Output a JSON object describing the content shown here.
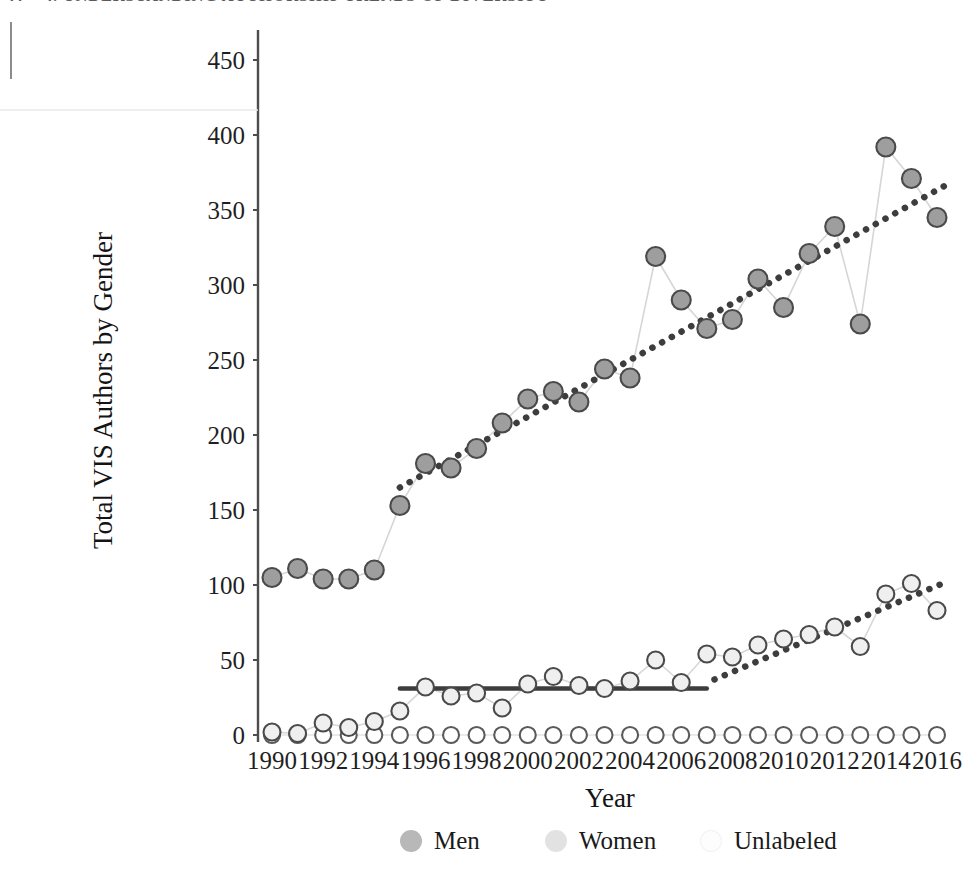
{
  "page_header": {
    "number": "44",
    "title": "4. UNDERSTANDING AUTHORSHIP TRENDS OF DIVERSITY"
  },
  "axis_titles": {
    "y": "Total VIS Authors by Gender",
    "x": "Year"
  },
  "legend": {
    "items": [
      {
        "label": "Men",
        "color": "#b8b8b8"
      },
      {
        "label": "Women",
        "color": "#e2e2e2"
      },
      {
        "label": "Unlabeled",
        "color": "#fdfdfd"
      }
    ]
  },
  "chart_data": {
    "type": "line",
    "title": "",
    "xlabel": "Year",
    "ylabel": "Total VIS Authors by Gender",
    "xlim": [
      1989.4,
      2016.8
    ],
    "ylim": [
      -12,
      462
    ],
    "yticks": [
      0,
      50,
      100,
      150,
      200,
      250,
      300,
      350,
      400,
      450
    ],
    "xticks": [
      1990,
      1992,
      1994,
      1996,
      1998,
      2000,
      2002,
      2004,
      2006,
      2008,
      2010,
      2012,
      2014,
      2016
    ],
    "grid": false,
    "legend_position": "bottom",
    "x": [
      1990,
      1991,
      1992,
      1993,
      1994,
      1995,
      1996,
      1997,
      1998,
      1999,
      2000,
      2001,
      2002,
      2003,
      2004,
      2005,
      2006,
      2007,
      2008,
      2009,
      2010,
      2011,
      2012,
      2013,
      2014,
      2015,
      2016
    ],
    "series": [
      {
        "name": "Men",
        "color": "#9e9e9e",
        "edge": "#4a4a4a",
        "values": [
          105,
          111,
          104,
          104,
          110,
          153,
          181,
          178,
          191,
          208,
          224,
          229,
          222,
          244,
          238,
          319,
          290,
          271,
          277,
          304,
          285,
          321,
          339,
          274,
          392,
          371,
          345
        ],
        "trendline": {
          "style": "dotted",
          "x_start": 1995,
          "x_end": 2016.5,
          "y_start": 165,
          "y_end": 368
        }
      },
      {
        "name": "Women",
        "color": "#efefef",
        "edge": "#4a4a4a",
        "values": [
          2,
          1,
          8,
          5,
          9,
          16,
          32,
          26,
          28,
          18,
          34,
          39,
          33,
          31,
          36,
          50,
          35,
          54,
          52,
          60,
          64,
          67,
          72,
          59,
          94,
          101,
          83
        ],
        "trendlines": [
          {
            "style": "solid",
            "x_start": 1995,
            "x_end": 2007,
            "y_start": 31,
            "y_end": 31
          },
          {
            "style": "dotted",
            "x_start": 2007.3,
            "x_end": 2016.5,
            "y_start": 37,
            "y_end": 103
          }
        ]
      },
      {
        "name": "Unlabeled",
        "color": "#ffffff",
        "edge": "#5a5a5a",
        "values": [
          0,
          0,
          0,
          0,
          0,
          0,
          0,
          0,
          0,
          0,
          0,
          0,
          0,
          0,
          0,
          0,
          0,
          0,
          0,
          0,
          0,
          0,
          0,
          0,
          0,
          0,
          0
        ]
      }
    ]
  }
}
